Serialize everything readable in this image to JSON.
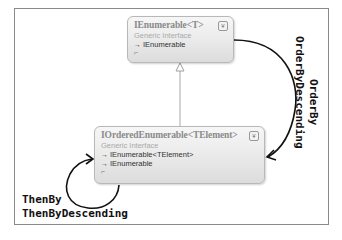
{
  "diagram": {
    "nodes": [
      {
        "id": "ienumerable",
        "title": "IEnumerable<T>",
        "kind": "Generic Interface",
        "members": [
          "IEnumerable"
        ],
        "member_icon": "→",
        "collapse_glyph": "¥",
        "expand_glyph": "⌐"
      },
      {
        "id": "iorderedenumerable",
        "title": "IOrderedEnumerable<TElement>",
        "kind": "Generic Interface",
        "members": [
          "IEnumerable<TElement>",
          "IEnumerable"
        ],
        "member_icon": "→",
        "collapse_glyph": "¥",
        "expand_glyph": "⌐"
      }
    ],
    "edges": [
      {
        "from": "iorderedenumerable",
        "to": "ienumerable",
        "type": "inheritance"
      },
      {
        "from": "ienumerable",
        "to": "iorderedenumerable",
        "type": "transition",
        "labels": [
          "OrderBy",
          "OrderByDescending"
        ]
      },
      {
        "from": "iorderedenumerable",
        "to": "iorderedenumerable",
        "type": "self-loop",
        "labels": [
          "ThenBy",
          "ThenByDescending"
        ]
      }
    ],
    "colors": {
      "box_border": "#b8b8b8",
      "title": "#8a8a8a",
      "arrow": "#111111",
      "inheritance": "#a0a0a0"
    }
  }
}
